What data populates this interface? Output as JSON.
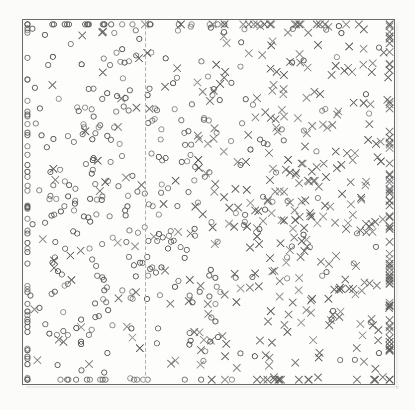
{
  "figure": {
    "title": "",
    "subtitle": "",
    "background_color": "#fbfbf9",
    "plot_background_color": "#fdfdfc",
    "frame_color": "#6a6a6a",
    "frame_left": 22,
    "frame_top": 19,
    "frame_width": 373,
    "frame_height": 366
  },
  "chart_data": {
    "type": "scatter",
    "title": "",
    "xlabel": "",
    "ylabel": "",
    "xlim": [
      0,
      1
    ],
    "ylim": [
      0,
      1
    ],
    "grid": false,
    "legend": "none",
    "xticks": [],
    "yticks": [],
    "annotations": [
      {
        "name": "decision-boundary",
        "type": "vline",
        "x": 0.33,
        "style": "dashed",
        "color": "#b0b0b0",
        "label": ""
      }
    ],
    "marker_size_px": 6,
    "marker_color": "#5a5a5a",
    "marker_linewidth": 1,
    "series": [
      {
        "name": "class-circle",
        "marker": "o",
        "color": "#5a5a5a",
        "filled": false,
        "count": 420,
        "distribution": "gaussian-mixture-left",
        "x_center": 0.26,
        "x_spread": 0.2,
        "y_center": 0.5,
        "y_spread": 0.32
      },
      {
        "name": "class-cross",
        "marker": "x",
        "color": "#5a5a5a",
        "filled": false,
        "count": 420,
        "distribution": "gaussian-mixture-right",
        "x_center": 0.74,
        "x_spread": 0.2,
        "y_center": 0.5,
        "y_spread": 0.32
      }
    ]
  }
}
